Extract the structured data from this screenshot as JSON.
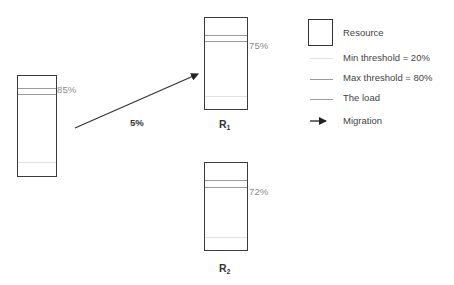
{
  "diagram": {
    "source_resource": {
      "load_label": "85%"
    },
    "migration": {
      "label": "5%"
    },
    "targets": [
      {
        "name": "R",
        "subscript": "1",
        "load_label": "75%"
      },
      {
        "name": "R",
        "subscript": "2",
        "load_label": "72%"
      }
    ]
  },
  "legend": {
    "items": [
      {
        "label": "Resource",
        "icon": "resource-box-icon"
      },
      {
        "label": "Min threshold = 20%",
        "icon": "min-threshold-line-icon",
        "color": "#e2e2e2"
      },
      {
        "label": "Max threshold = 80%",
        "icon": "max-threshold-line-icon",
        "color": "#9a9a9a"
      },
      {
        "label": "The load",
        "icon": "load-line-icon",
        "color": "#9a9a9a"
      },
      {
        "label": "Migration",
        "icon": "arrow-right-icon",
        "color": "#222222"
      }
    ]
  }
}
